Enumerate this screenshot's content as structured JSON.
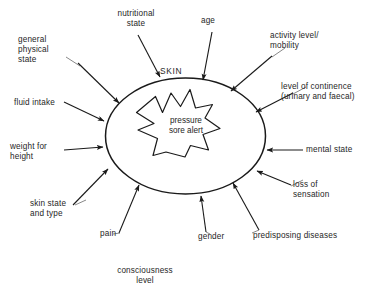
{
  "diagram": {
    "core": {
      "star_text": "pressure\nsore alert",
      "ellipse_label": "SKIN"
    },
    "colors": {
      "stroke": "#1a1a1a",
      "text": "#262626",
      "background": "#ffffff",
      "leader_line": "#4d4d4d"
    },
    "factors": [
      {
        "id": "nutritional-state",
        "text": "nutritional\nstate"
      },
      {
        "id": "age",
        "text": "age"
      },
      {
        "id": "activity-level",
        "text": "activity level/\nmobility"
      },
      {
        "id": "general-physical-state",
        "text": "general\nphysical\nstate"
      },
      {
        "id": "level-of-continence",
        "text": "level of continence\n(urinary and faecal)"
      },
      {
        "id": "fluid-intake",
        "text": "fluid intake"
      },
      {
        "id": "mental-state",
        "text": "mental state"
      },
      {
        "id": "weight-for-height",
        "text": "weight for\nheight"
      },
      {
        "id": "loss-of-sensation",
        "text": "loss of\nsensation"
      },
      {
        "id": "skin-state-and-type",
        "text": "skin state\nand type"
      },
      {
        "id": "pain",
        "text": "pain"
      },
      {
        "id": "gender",
        "text": "gender"
      },
      {
        "id": "predisposing-diseases",
        "text": "predisposing diseases"
      },
      {
        "id": "consciousness-level",
        "text": "consciousness\nlevel"
      }
    ]
  }
}
